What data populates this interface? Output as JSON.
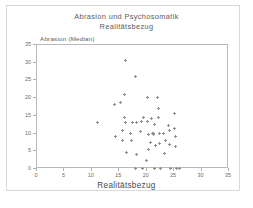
{
  "figure": {
    "title_line1": "Abrasion und Psychosomatik",
    "title_line2": "Realitätsbezug",
    "background_color": "#ffffff",
    "frame_color": "#b9b9b9",
    "marker_color": "#8e8e8e",
    "text_color": "#5a5a5a"
  },
  "chart_data": {
    "type": "scatter",
    "title": "Abrasion und Psychosomatik Realitätsbezug",
    "xlabel": "Realitätsbezug",
    "ylabel": "Abrasion (Median)",
    "xlim": [
      0,
      35
    ],
    "ylim": [
      0,
      35
    ],
    "xticks": [
      0,
      5,
      10,
      15,
      20,
      25,
      30,
      35
    ],
    "yticks": [
      0,
      5,
      10,
      15,
      20,
      25,
      30,
      35
    ],
    "xtick_labels": [
      "0",
      "5",
      "10",
      "15",
      "20",
      "25",
      "30",
      "35"
    ],
    "ytick_labels": [
      "0",
      "5",
      "10",
      "15",
      "20",
      "25",
      "30",
      "35"
    ],
    "grid": false,
    "legend": false,
    "marker": "plus",
    "series": [
      {
        "name": "Abrasion (Median)",
        "points": [
          [
            11.0,
            13.0
          ],
          [
            14.2,
            18.3
          ],
          [
            14.3,
            9.2
          ],
          [
            15.3,
            18.9
          ],
          [
            16.0,
            21.0
          ],
          [
            16.2,
            30.5
          ],
          [
            16.0,
            14.6
          ],
          [
            16.1,
            13.2
          ],
          [
            15.6,
            11.0
          ],
          [
            15.5,
            8.0
          ],
          [
            16.3,
            4.6
          ],
          [
            17.0,
            10.1
          ],
          [
            17.2,
            8.1
          ],
          [
            17.4,
            13.2
          ],
          [
            18.0,
            26.1
          ],
          [
            18.1,
            13.1
          ],
          [
            18.2,
            4.2
          ],
          [
            18.9,
            10.6
          ],
          [
            19.0,
            13.4
          ],
          [
            19.4,
            14.5
          ],
          [
            20.0,
            2.3
          ],
          [
            20.1,
            13.4
          ],
          [
            20.2,
            20.3
          ],
          [
            20.3,
            9.7
          ],
          [
            20.4,
            5.4
          ],
          [
            20.6,
            7.6
          ],
          [
            20.9,
            14.2
          ],
          [
            21.0,
            10.0
          ],
          [
            21.2,
            9.8
          ],
          [
            21.3,
            9.9
          ],
          [
            21.4,
            12.7
          ],
          [
            21.5,
            0.1
          ],
          [
            21.6,
            6.6
          ],
          [
            22.0,
            20.3
          ],
          [
            22.1,
            17.2
          ],
          [
            22.2,
            14.6
          ],
          [
            22.3,
            10.0
          ],
          [
            22.4,
            7.2
          ],
          [
            22.5,
            0.1
          ],
          [
            23.0,
            9.9
          ],
          [
            23.2,
            4.3
          ],
          [
            23.4,
            8.1
          ],
          [
            24.0,
            12.2
          ],
          [
            24.1,
            10.9
          ],
          [
            24.2,
            6.9
          ],
          [
            24.3,
            0.1
          ],
          [
            25.0,
            15.8
          ],
          [
            25.1,
            11.3
          ],
          [
            25.2,
            9.1
          ],
          [
            25.3,
            6.4
          ],
          [
            25.4,
            0.1
          ],
          [
            26.0,
            0.1
          ],
          [
            19.2,
            0.2
          ],
          [
            17.9,
            0.2
          ]
        ]
      }
    ]
  }
}
